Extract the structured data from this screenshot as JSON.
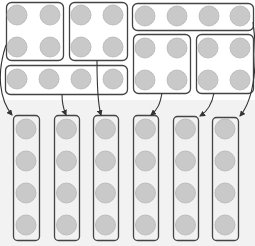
{
  "diagram": {
    "colors": {
      "counter_fill": "#c9c9c9",
      "counter_stroke": "#b5b5b5",
      "box_stroke": "#444444",
      "arrow": "#333333",
      "background": "#ffffff",
      "lower_background": "#f2f2f2"
    },
    "source_groups": [
      {
        "id": "group-1",
        "layout": "2x2",
        "x": 6,
        "y": 2,
        "w": 57,
        "h": 58,
        "counters": [
          [
            17,
            15
          ],
          [
            50,
            15
          ],
          [
            17,
            47
          ],
          [
            50,
            47
          ]
        ]
      },
      {
        "id": "group-2",
        "layout": "2x2",
        "x": 69,
        "y": 2,
        "w": 58,
        "h": 58,
        "counters": [
          [
            81,
            15
          ],
          [
            113,
            15
          ],
          [
            81,
            47
          ],
          [
            113,
            47
          ]
        ]
      },
      {
        "id": "group-3",
        "layout": "1x4",
        "x": 132,
        "y": 3,
        "w": 121,
        "h": 27,
        "counters": [
          [
            145,
            16
          ],
          [
            177,
            16
          ],
          [
            209,
            16
          ],
          [
            240,
            16
          ]
        ]
      },
      {
        "id": "group-4",
        "layout": "2x2",
        "x": 133,
        "y": 34,
        "w": 57,
        "h": 59,
        "counters": [
          [
            145,
            48
          ],
          [
            177,
            48
          ],
          [
            145,
            80
          ],
          [
            177,
            80
          ]
        ]
      },
      {
        "id": "group-5",
        "layout": "2x2",
        "x": 196,
        "y": 34,
        "w": 57,
        "h": 59,
        "counters": [
          [
            208,
            48
          ],
          [
            240,
            48
          ],
          [
            208,
            80
          ],
          [
            240,
            80
          ]
        ]
      },
      {
        "id": "group-6",
        "layout": "1x4",
        "x": 5,
        "y": 65,
        "w": 122,
        "h": 29,
        "counters": [
          [
            17,
            79
          ],
          [
            49,
            79
          ],
          [
            81,
            79
          ],
          [
            113,
            79
          ]
        ]
      }
    ],
    "target_columns": [
      {
        "id": "column-1",
        "x": 13,
        "y": 115,
        "w": 26,
        "h": 125,
        "from": "group-1"
      },
      {
        "id": "column-2",
        "x": 54,
        "y": 115,
        "w": 25,
        "h": 125,
        "from": "group-6"
      },
      {
        "id": "column-3",
        "x": 93,
        "y": 115,
        "w": 25,
        "h": 125,
        "from": "group-2"
      },
      {
        "id": "column-4",
        "x": 133,
        "y": 115,
        "w": 25,
        "h": 125,
        "from": "group-4"
      },
      {
        "id": "column-5",
        "x": 173,
        "y": 116,
        "w": 25,
        "h": 124,
        "from": "group-5"
      },
      {
        "id": "column-6",
        "x": 212,
        "y": 117,
        "w": 26,
        "h": 123,
        "from": "group-3"
      }
    ],
    "column_counter_rows": [
      129,
      161,
      193,
      225
    ],
    "arrows": [
      {
        "id": "arrow-group1-to-col1",
        "d": "M6,45 C-4,75 0,100 12,115"
      },
      {
        "id": "arrow-group6-to-col2",
        "d": "M62,94 C62,104 63,108 66,115"
      },
      {
        "id": "arrow-group2-to-col3",
        "d": "M97,60 C97,90 98,105 101,115"
      },
      {
        "id": "arrow-group4-to-col4",
        "d": "M162,93 C160,104 158,109 151,115"
      },
      {
        "id": "arrow-group5-to-col5",
        "d": "M214,93 C212,104 208,111 200,116"
      },
      {
        "id": "arrow-group3-to-col6",
        "d": "M253,22 C258,60 255,98 240,116"
      }
    ]
  }
}
